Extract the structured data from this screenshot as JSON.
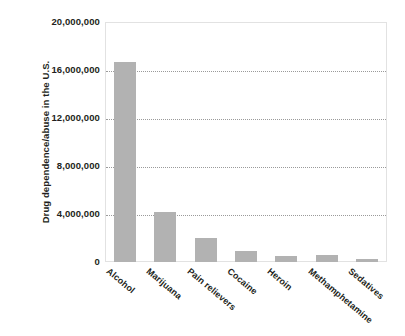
{
  "chart_data": {
    "type": "bar",
    "title": "",
    "subtitle": "",
    "xlabel": "",
    "ylabel": "Drug dependence/abuse in the U.S.",
    "categories": [
      "Alcohol",
      "Marijuana",
      "Pain relievers",
      "Cocaine",
      "Heroin",
      "Methamphetamine",
      "Sedatives"
    ],
    "values": [
      16700000,
      4200000,
      2000000,
      900000,
      500000,
      550000,
      250000
    ],
    "ylim": [
      0,
      20000000
    ],
    "y_ticks": [
      0,
      4000000,
      8000000,
      12000000,
      16000000,
      20000000
    ],
    "y_tick_labels": [
      "0",
      "4,000,000",
      "8,000,000",
      "12,000,000",
      "16,000,000",
      "20,000,000"
    ],
    "grid": true,
    "grid_style": "dotted",
    "legend": false,
    "legend_position": "none",
    "bar_color": "#b2b2b2",
    "grid_color": "#9a9a9a",
    "axis_border_color": "#e2e2e2",
    "text_color": "#231f20",
    "background_color": "#ffffff",
    "x_label_rotation": -40
  }
}
